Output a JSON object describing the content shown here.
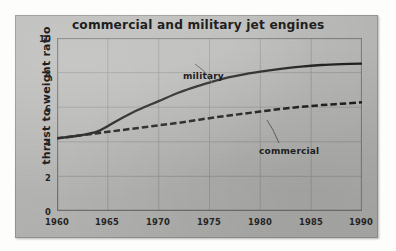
{
  "figure": {
    "title": "commercial and military jet engines",
    "frame_color": "#b4b4b2"
  },
  "chart_data": {
    "type": "line",
    "title": "commercial and military jet engines",
    "xlabel": "",
    "ylabel": "thrust to weight ratio",
    "xlim": [
      1960,
      1990
    ],
    "ylim": [
      0,
      10
    ],
    "xticks": [
      "1960",
      "1965",
      "1970",
      "1975",
      "1980",
      "1985",
      "1990"
    ],
    "yticks": [
      "0",
      "2",
      "4",
      "6",
      "8",
      "10"
    ],
    "grid": true,
    "legend": "inline-annotations",
    "annotations": [
      {
        "text": "military",
        "points_to_series": "military"
      },
      {
        "text": "commercial",
        "points_to_series": "commercial"
      }
    ],
    "x": [
      1960,
      1962,
      1964,
      1966,
      1968,
      1970,
      1972,
      1974,
      1976,
      1978,
      1980,
      1982,
      1984,
      1986,
      1988,
      1990
    ],
    "series": [
      {
        "name": "military",
        "style": "solid",
        "color": "#1a1a1a",
        "values": [
          4.2,
          4.35,
          4.6,
          5.25,
          5.85,
          6.35,
          6.85,
          7.25,
          7.6,
          7.85,
          8.05,
          8.22,
          8.35,
          8.44,
          8.49,
          8.52
        ]
      },
      {
        "name": "commercial",
        "style": "dashed",
        "color": "#1a1a1a",
        "values": [
          4.2,
          4.35,
          4.5,
          4.65,
          4.8,
          4.95,
          5.1,
          5.28,
          5.45,
          5.6,
          5.75,
          5.9,
          6.02,
          6.12,
          6.2,
          6.28
        ]
      }
    ]
  },
  "yticklabels": [
    {
      "value": "10",
      "y": 10
    },
    {
      "value": "8",
      "y": 8
    },
    {
      "value": "6",
      "y": 6
    },
    {
      "value": "4",
      "y": 4
    },
    {
      "value": "2",
      "y": 2
    },
    {
      "value": "0",
      "y": 0
    }
  ],
  "xticklabels": [
    {
      "value": "1960",
      "x": 1960
    },
    {
      "value": "1965",
      "x": 1965
    },
    {
      "value": "1970",
      "x": 1970
    },
    {
      "value": "1975",
      "x": 1975
    },
    {
      "value": "1980",
      "x": 1980
    },
    {
      "value": "1985",
      "x": 1985
    },
    {
      "value": "1990",
      "x": 1990
    }
  ],
  "labels": {
    "military": "military",
    "commercial": "commercial"
  }
}
